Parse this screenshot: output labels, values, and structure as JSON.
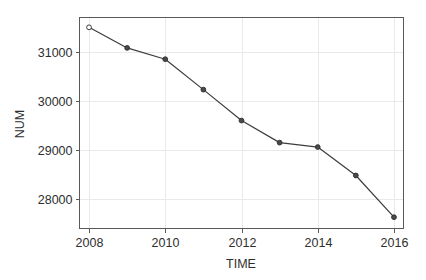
{
  "chart_data": {
    "type": "line",
    "title": "",
    "subtitle": "",
    "xlabel": "TIME",
    "ylabel": "NUM",
    "x": [
      2008,
      2009,
      2010,
      2011,
      2012,
      2013,
      2014,
      2015,
      2016
    ],
    "values": [
      31500,
      31080,
      30850,
      30230,
      29600,
      29150,
      29060,
      28480,
      27630
    ],
    "series": [
      {
        "name": "NUM",
        "values": [
          31500,
          31080,
          30850,
          30230,
          29600,
          29150,
          29060,
          28480,
          27630
        ]
      }
    ],
    "xlim": [
      2007.75,
      2016.25
    ],
    "ylim": [
      27400,
      31700
    ],
    "xticks": [
      2008,
      2010,
      2012,
      2014,
      2016
    ],
    "xtick_labels": [
      "2008",
      "2010",
      "2012",
      "2014",
      "2016"
    ],
    "yticks": [
      28000,
      29000,
      30000,
      31000
    ],
    "ytick_labels": [
      "28000",
      "29000",
      "30000",
      "31000"
    ],
    "grid": true,
    "grid_axis": "both",
    "legend": false,
    "legend_position": "none",
    "marker": "circle",
    "line_color": "#3c3c3c",
    "marker_color": "#4a4a4a",
    "grid_color": "#e9e9ec",
    "axis_color": "#595959",
    "background_color": "#ffffff"
  },
  "axes": {
    "y_title": "NUM",
    "x_title": "TIME"
  }
}
